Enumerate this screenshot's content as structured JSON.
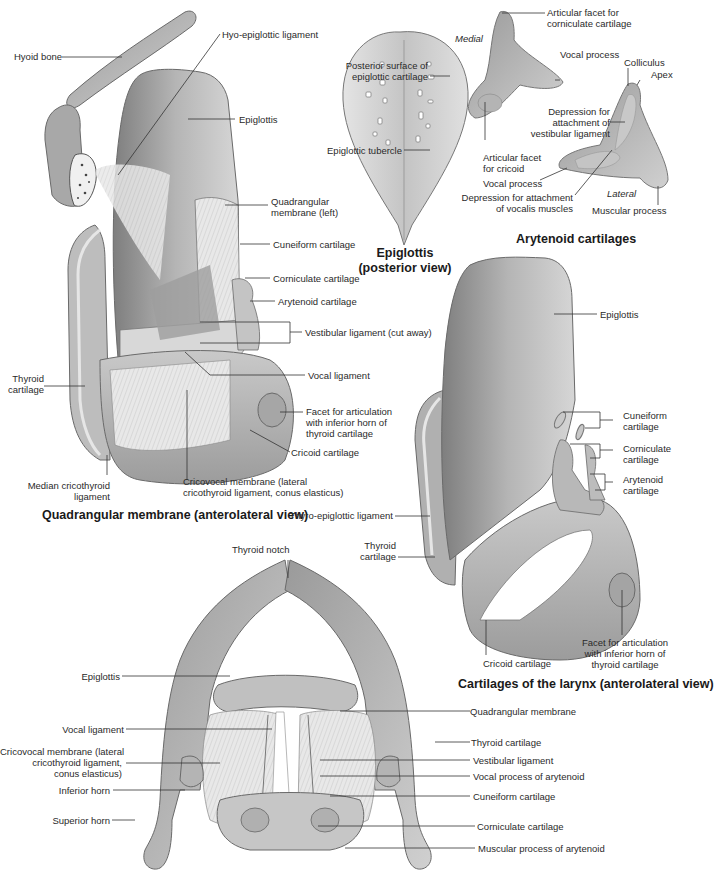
{
  "figure": {
    "panels": [
      {
        "id": "quadrangular",
        "title": "Quadrangular membrane (anterolateral view)",
        "labels": [
          "Hyoid bone",
          "Hyo-epiglottic ligament",
          "Epiglottis",
          "Quadrangular membrane (left)",
          "Cuneiform cartilage",
          "Corniculate cartilage",
          "Arytenoid cartilage",
          "Vestibular ligament (cut away)",
          "Thyroid cartilage",
          "Vocal ligament",
          "Facet for articulation with inferior horn of thyroid cartilage",
          "Cricoid cartilage",
          "Median cricothyroid ligament",
          "Cricovocal membrane (lateral cricothyroid ligament, conus elasticus)"
        ]
      },
      {
        "id": "epiglottis",
        "title": "Epiglottis (posterior view)",
        "title_lines": [
          "Epiglottis",
          "(posterior view)"
        ],
        "labels": [
          "Posterior surface of epiglottic cartilage",
          "Epiglottic tubercle"
        ]
      },
      {
        "id": "arytenoid",
        "title": "Arytenoid cartilages",
        "orientation": [
          "Medial",
          "Lateral"
        ],
        "labels": [
          "Articular facet for corniculate cartilage",
          "Vocal process",
          "Colliculus",
          "Apex",
          "Depression for attachment of vestibular ligament",
          "Articular facet for cricoid",
          "Vocal process",
          "Depression for attachment of vocalis muscles",
          "Muscular process"
        ]
      },
      {
        "id": "cartilages",
        "title": "Cartilages of the larynx (anterolateral view)",
        "labels": [
          "Epiglottis",
          "Cuneiform cartilage",
          "Corniculate cartilage",
          "Arytenoid cartilage",
          "Thyro-epiglottic ligament",
          "Thyroid cartilage",
          "Cricoid cartilage",
          "Facet for articulation with inferior horn of thyroid cartilage"
        ]
      },
      {
        "id": "superior",
        "title": "",
        "labels": [
          "Thyroid notch",
          "Epiglottis",
          "Vocal ligament",
          "Cricovocal membrane (lateral cricothyroid ligament, conus elasticus)",
          "Inferior horn",
          "Superior horn",
          "Quadrangular membrane",
          "Thyroid cartilage",
          "Vestibular ligament",
          "Vocal process of arytenoid",
          "Cuneiform cartilage",
          "Corniculate cartilage",
          "Muscular process of arytenoid"
        ]
      }
    ]
  },
  "text": {
    "hyoid_bone": "Hyoid bone",
    "hyo_epi": "Hyo-epiglottic ligament",
    "epi1": "Epiglottis",
    "quad_left_1": "Quadrangular",
    "quad_left_2": "membrane (left)",
    "cune1": "Cuneiform cartilage",
    "corn1": "Corniculate cartilage",
    "aryt1": "Arytenoid cartilage",
    "vest_cut": "Vestibular ligament (cut away)",
    "thy1_1": "Thyroid",
    "thy1_2": "cartilage",
    "vocal1": "Vocal ligament",
    "facet1_1": "Facet for articulation",
    "facet1_2": "with inferior horn of",
    "facet1_3": "thyroid cartilage",
    "cric1": "Cricoid cartilage",
    "median_1": "Median cricothyroid",
    "median_2": "ligament",
    "cricovocal1_1": "Cricovocal membrane (lateral",
    "cricovocal1_2": "cricothyroid ligament, conus elasticus)",
    "title_quad": "Quadrangular membrane (anterolateral view)",
    "post_surf_1": "Posterior surface of",
    "post_surf_2": "epiglottic cartilage",
    "epi_tub": "Epiglottic tubercle",
    "title_epi_1": "Epiglottis",
    "title_epi_2": "(posterior view)",
    "medial": "Medial",
    "lateral": "Lateral",
    "art_corn_1": "Articular facet for",
    "art_corn_2": "corniculate cartilage",
    "vocal_proc_a": "Vocal process",
    "colliculus": "Colliculus",
    "apex": "Apex",
    "dep_vest_1": "Depression for",
    "dep_vest_2": "attachment of",
    "dep_vest_3": "vestibular ligament",
    "art_cric_1": "Articular facet",
    "art_cric_2": "for cricoid",
    "vocal_proc_b": "Vocal process",
    "dep_voc_1": "Depression for attachment",
    "dep_voc_2": "of vocalis muscles",
    "musc_proc": "Muscular process",
    "title_aryt": "Arytenoid cartilages",
    "epi2": "Epiglottis",
    "cune2_1": "Cuneiform",
    "cune2_2": "cartilage",
    "corn2_1": "Corniculate",
    "corn2_2": "cartilage",
    "aryt2_1": "Arytenoid",
    "aryt2_2": "cartilage",
    "thyro_epi": "Thyro-epiglottic ligament",
    "thy2_1": "Thyroid",
    "thy2_2": "cartilage",
    "cric2": "Cricoid cartilage",
    "facet2_1": "Facet for articulation",
    "facet2_2": "with inferior horn of",
    "facet2_3": "thyroid cartilage",
    "title_cart": "Cartilages of the larynx (anterolateral view)",
    "thy_notch": "Thyroid notch",
    "epi3": "Epiglottis",
    "vocal3": "Vocal ligament",
    "cricovocal3_1": "Cricovocal membrane (lateral",
    "cricovocal3_2": "cricothyroid ligament,",
    "cricovocal3_3": "conus elasticus)",
    "inf_horn": "Inferior horn",
    "sup_horn": "Superior horn",
    "quad3": "Quadrangular membrane",
    "thy3": "Thyroid cartilage",
    "vest3": "Vestibular ligament",
    "vocproc3": "Vocal process of arytenoid",
    "cune3": "Cuneiform cartilage",
    "corn3": "Corniculate cartilage",
    "musc3": "Muscular process of arytenoid"
  },
  "colors": {
    "cartilage_light": "#d8d8d8",
    "cartilage_mid": "#b8b8b8",
    "cartilage_dark": "#8c8c8c",
    "outline": "#6a6a6a",
    "leader": "#333333"
  }
}
